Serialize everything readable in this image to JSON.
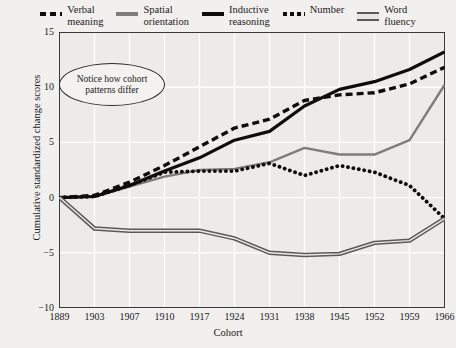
{
  "legend": {
    "items": [
      {
        "label": "Verbal\nmeaning",
        "style": "dashed",
        "color": "#0d0d0d"
      },
      {
        "label": "Spatial\norientation",
        "style": "solid-gray",
        "color": "#7d7d7d"
      },
      {
        "label": "Inductive\nreasoning",
        "style": "solid-black",
        "color": "#0d0d0d"
      },
      {
        "label": "Number",
        "style": "dotted",
        "color": "#0d0d0d"
      },
      {
        "label": "Word\nfluency",
        "style": "double",
        "color": "#5a5a5a"
      }
    ]
  },
  "annotation": {
    "text": "Notice how cohort\npatterns differ"
  },
  "chart_data": {
    "type": "line",
    "title": "",
    "xlabel": "Cohort",
    "ylabel": "Cumulative standardized change scores",
    "categories": [
      "1889",
      "1903",
      "1907",
      "1910",
      "1917",
      "1924",
      "1931",
      "1938",
      "1945",
      "1952",
      "1959",
      "1966"
    ],
    "yticks": [
      15,
      10,
      5,
      0,
      -5,
      -10
    ],
    "ylim": [
      -10,
      15
    ],
    "grid": true,
    "legend_position": "top",
    "series": [
      {
        "name": "Verbal meaning",
        "style": "dashed",
        "color": "#0d0d0d",
        "values": [
          0,
          0.2,
          1.4,
          2.9,
          4.6,
          6.3,
          7.1,
          8.8,
          9.3,
          9.5,
          10.3,
          11.8
        ]
      },
      {
        "name": "Spatial orientation",
        "style": "solid-gray",
        "color": "#7d7d7d",
        "values": [
          0,
          0.1,
          1.0,
          1.9,
          2.5,
          2.6,
          3.2,
          4.5,
          3.9,
          3.9,
          5.2,
          10.2
        ]
      },
      {
        "name": "Inductive reasoning",
        "style": "solid-black",
        "color": "#0d0d0d",
        "values": [
          0,
          0.1,
          1.1,
          2.4,
          3.6,
          5.2,
          6.0,
          8.3,
          9.8,
          10.5,
          11.6,
          13.2
        ]
      },
      {
        "name": "Number",
        "style": "dotted",
        "color": "#0d0d0d",
        "values": [
          0,
          0.1,
          1.1,
          2.3,
          2.4,
          2.4,
          3.1,
          2.0,
          2.9,
          2.3,
          1.1,
          -1.9
        ]
      },
      {
        "name": "Word fluency",
        "style": "double",
        "color": "#5a5a5a",
        "values": [
          0,
          -2.8,
          -3.0,
          -3.0,
          -3.0,
          -3.7,
          -5.0,
          -5.2,
          -5.1,
          -4.1,
          -3.9,
          -1.9
        ]
      }
    ]
  }
}
